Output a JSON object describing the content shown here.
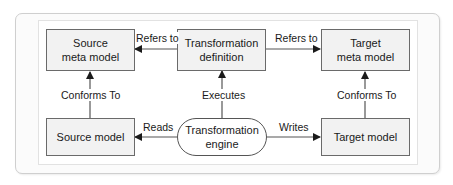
{
  "diagram": {
    "nodes": {
      "source_meta_model": {
        "line1": "Source",
        "line2": "meta model"
      },
      "transformation_definition": {
        "line1": "Transformation",
        "line2": "definition"
      },
      "target_meta_model": {
        "line1": "Target",
        "line2": "meta model"
      },
      "source_model": {
        "label": "Source model"
      },
      "transformation_engine": {
        "line1": "Transformation",
        "line2": "engine"
      },
      "target_model": {
        "label": "Target model"
      }
    },
    "edges": {
      "def_to_source_meta": "Refers to",
      "def_to_target_meta": "Refers to",
      "source_model_to_meta": "Conforms To",
      "engine_to_def": "Executes",
      "target_model_to_meta": "Conforms To",
      "engine_to_source_model": "Reads",
      "engine_to_target_model": "Writes"
    },
    "colors": {
      "node_fill": "#f2f2f2",
      "node_border": "#6a6a6a",
      "engine_fill": "#ffffff",
      "edge": "#555555"
    }
  }
}
